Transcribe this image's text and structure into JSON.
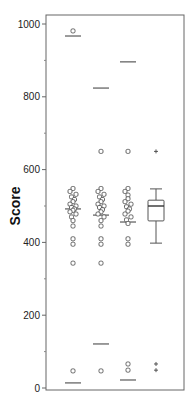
{
  "chart_data": {
    "type": "scatter",
    "title": "",
    "xlabel": "",
    "ylabel": "Score",
    "ylim": [
      0,
      1000
    ],
    "yticks_major": [
      0,
      200,
      400,
      600,
      800,
      1000
    ],
    "yticks_minor": [
      100,
      300,
      500,
      700,
      900
    ],
    "ytick_labels": [
      "0",
      "200",
      "400",
      "600",
      "800",
      "1000"
    ],
    "grid": false,
    "legend": null,
    "categories": [
      "1",
      "2",
      "3",
      "4"
    ],
    "series": [
      {
        "name": "group-1",
        "kind": "dot-strip",
        "marker": "square-circle",
        "points": [
          981,
          548,
          540,
          532,
          525,
          518,
          512,
          505,
          500,
          496,
          492,
          488,
          484,
          478,
          470,
          460,
          445,
          410,
          395,
          343,
          47
        ],
        "lines": [
          967,
          492,
          14
        ]
      },
      {
        "name": "group-2",
        "kind": "dot-strip",
        "marker": "square-circle",
        "points": [
          650,
          548,
          540,
          532,
          525,
          518,
          512,
          505,
          500,
          496,
          490,
          484,
          478,
          470,
          460,
          445,
          410,
          395,
          343,
          47
        ],
        "lines": [
          824,
          475,
          121
        ]
      },
      {
        "name": "group-3",
        "kind": "dot-strip",
        "marker": "square-circle",
        "points": [
          650,
          548,
          540,
          530,
          520,
          512,
          505,
          498,
          492,
          486,
          478,
          470,
          462,
          452,
          410,
          395,
          66,
          49
        ],
        "lines": [
          896,
          456,
          22
        ]
      },
      {
        "name": "group-4",
        "kind": "boxplot",
        "whisker_high": 547,
        "q3": 516,
        "median": 500,
        "q1": 459,
        "whisker_low": 398,
        "outliers": [
          650,
          66,
          49
        ],
        "outlier_marker": "plus"
      }
    ]
  },
  "axis": {
    "ylabel": "Score",
    "tick_labels": [
      "0",
      "200",
      "400",
      "600",
      "800",
      "1000"
    ]
  }
}
